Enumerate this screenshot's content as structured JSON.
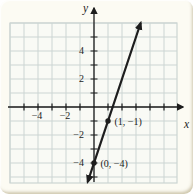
{
  "chart_data": {
    "type": "line",
    "title": "",
    "xlabel": "x",
    "ylabel": "y",
    "xlim": [
      -6,
      6
    ],
    "ylim": [
      -5.4,
      6
    ],
    "grid": true,
    "tick_step": 1,
    "legend": false,
    "x_tick_labels": [
      {
        "value": -4,
        "label": "−4"
      },
      {
        "value": -2,
        "label": "−2"
      }
    ],
    "y_tick_labels": [
      {
        "value": 4,
        "label": "4"
      },
      {
        "value": 2,
        "label": "2"
      },
      {
        "value": -2,
        "label": "−2"
      },
      {
        "value": -4,
        "label": "−4"
      }
    ],
    "series": [
      {
        "name": "line",
        "slope": 3,
        "y_intercept": -4,
        "points": [
          [
            0,
            -4
          ],
          [
            1,
            -1
          ]
        ]
      }
    ],
    "labeled_points": [
      {
        "x": 1,
        "y": -1,
        "label": "(1, −1)"
      },
      {
        "x": 0,
        "y": -4,
        "label": "(0, −4)"
      }
    ]
  },
  "colors": {
    "ink": "#1d1d1d",
    "grid_line": "#ccd5d3",
    "plot_bg": "#f9faf5",
    "page_bg": "#fcfbf3",
    "edge_shadow": "#d9d2bd"
  }
}
